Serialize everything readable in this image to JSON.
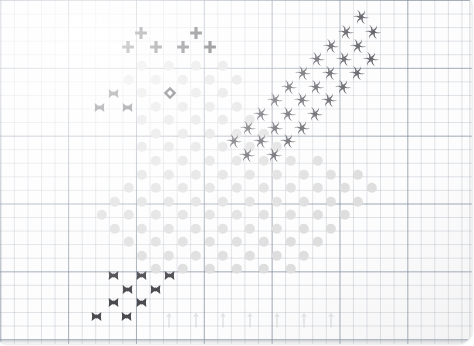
{
  "page": {
    "background_color": "#fdfdfd",
    "grid": {
      "minor_cell_px": 13.57,
      "minor_color": "#96a0af",
      "major_cell_px": 67.85,
      "major_color": "#7884 96",
      "origin_x": 6.3,
      "origin_y": 6.0
    }
  },
  "legend": {
    "dot": {
      "name": "light-gray-dot",
      "color": "#dedede",
      "size_px": 10.4
    },
    "cross": {
      "name": "x-marker",
      "color": "#4a4a4f",
      "size_px": 13
    },
    "plus": {
      "name": "plus-marker",
      "color": "#3c3c41",
      "size_px": 14
    },
    "ring": {
      "name": "hollow-diamond-marker",
      "color": "#2e2e33",
      "size_px": 14
    },
    "pinwheel": {
      "name": "pinwheel-marker",
      "color": "#55555c",
      "size_px": 17
    },
    "arrow": {
      "name": "up-arrow-tick",
      "color": "#b9bcc2",
      "size_px": 17
    }
  },
  "chart_data": {
    "type": "scatter",
    "title": "",
    "subtitle": "",
    "xlabel": "",
    "ylabel": "",
    "grid": true,
    "legend_position": "none",
    "xlim": [
      0,
      474
    ],
    "ylim": [
      0,
      346
    ],
    "note": "Pixel coordinates of every plotted marker, grouped by marker series.",
    "series": [
      {
        "name": "dot",
        "marker": "filled-circle",
        "color": "#dedede",
        "points": [
          [
            142,
            66
          ],
          [
            169,
            66
          ],
          [
            196,
            66
          ],
          [
            223,
            66
          ],
          [
            129,
            80
          ],
          [
            156,
            80
          ],
          [
            183,
            80
          ],
          [
            210,
            80
          ],
          [
            237,
            80
          ],
          [
            142,
            93
          ],
          [
            196,
            93
          ],
          [
            223,
            93
          ],
          [
            156,
            107
          ],
          [
            183,
            107
          ],
          [
            210,
            107
          ],
          [
            237,
            107
          ],
          [
            142,
            120
          ],
          [
            169,
            120
          ],
          [
            196,
            120
          ],
          [
            223,
            120
          ],
          [
            250,
            120
          ],
          [
            156,
            134
          ],
          [
            183,
            134
          ],
          [
            210,
            134
          ],
          [
            237,
            134
          ],
          [
            264,
            134
          ],
          [
            142,
            147
          ],
          [
            169,
            147
          ],
          [
            196,
            147
          ],
          [
            223,
            147
          ],
          [
            250,
            147
          ],
          [
            277,
            147
          ],
          [
            156,
            161
          ],
          [
            183,
            161
          ],
          [
            210,
            161
          ],
          [
            237,
            161
          ],
          [
            264,
            161
          ],
          [
            291,
            161
          ],
          [
            318,
            161
          ],
          [
            142,
            175
          ],
          [
            169,
            175
          ],
          [
            196,
            175
          ],
          [
            223,
            175
          ],
          [
            250,
            175
          ],
          [
            277,
            175
          ],
          [
            304,
            175
          ],
          [
            331,
            175
          ],
          [
            358,
            175
          ],
          [
            129,
            188
          ],
          [
            156,
            188
          ],
          [
            183,
            188
          ],
          [
            210,
            188
          ],
          [
            237,
            188
          ],
          [
            264,
            188
          ],
          [
            291,
            188
          ],
          [
            318,
            188
          ],
          [
            345,
            188
          ],
          [
            372,
            188
          ],
          [
            115,
            202
          ],
          [
            142,
            202
          ],
          [
            169,
            202
          ],
          [
            196,
            202
          ],
          [
            223,
            202
          ],
          [
            250,
            202
          ],
          [
            277,
            202
          ],
          [
            304,
            202
          ],
          [
            331,
            202
          ],
          [
            358,
            202
          ],
          [
            102,
            215
          ],
          [
            129,
            215
          ],
          [
            156,
            215
          ],
          [
            183,
            215
          ],
          [
            210,
            215
          ],
          [
            237,
            215
          ],
          [
            264,
            215
          ],
          [
            291,
            215
          ],
          [
            318,
            215
          ],
          [
            345,
            215
          ],
          [
            115,
            229
          ],
          [
            142,
            229
          ],
          [
            169,
            229
          ],
          [
            196,
            229
          ],
          [
            223,
            229
          ],
          [
            250,
            229
          ],
          [
            277,
            229
          ],
          [
            304,
            229
          ],
          [
            331,
            229
          ],
          [
            129,
            242
          ],
          [
            156,
            242
          ],
          [
            183,
            242
          ],
          [
            210,
            242
          ],
          [
            237,
            242
          ],
          [
            264,
            242
          ],
          [
            291,
            242
          ],
          [
            318,
            242
          ],
          [
            142,
            256
          ],
          [
            169,
            256
          ],
          [
            196,
            256
          ],
          [
            223,
            256
          ],
          [
            250,
            256
          ],
          [
            277,
            256
          ],
          [
            156,
            269
          ],
          [
            183,
            269
          ],
          [
            210,
            269
          ],
          [
            237,
            269
          ],
          [
            264,
            269
          ],
          [
            304,
            256
          ],
          [
            291,
            269
          ]
        ]
      },
      {
        "name": "plus",
        "marker": "plus",
        "color": "#3c3c41",
        "points": [
          [
            141,
            33
          ],
          [
            196,
            33
          ],
          [
            128,
            47
          ],
          [
            156,
            47
          ],
          [
            183,
            47
          ],
          [
            210,
            47
          ]
        ]
      },
      {
        "name": "cross",
        "marker": "x",
        "color": "#4a4a4f",
        "points": [
          [
            113,
            93
          ],
          [
            99,
            107
          ],
          [
            127,
            107
          ],
          [
            113,
            275
          ],
          [
            141,
            275
          ],
          [
            169,
            275
          ],
          [
            127,
            289
          ],
          [
            155,
            289
          ],
          [
            113,
            302
          ],
          [
            141,
            302
          ],
          [
            96,
            316
          ],
          [
            126,
            316
          ]
        ]
      },
      {
        "name": "ring",
        "marker": "hollow-diamond",
        "color": "#2e2e33",
        "points": [
          [
            170,
            93
          ]
        ]
      },
      {
        "name": "pinwheel",
        "marker": "pinwheel",
        "color": "#55555c",
        "points": [
          [
            361,
            17
          ],
          [
            346,
            32
          ],
          [
            373,
            32
          ],
          [
            331,
            46
          ],
          [
            358,
            46
          ],
          [
            317,
            59
          ],
          [
            344,
            59
          ],
          [
            371,
            59
          ],
          [
            303,
            73
          ],
          [
            330,
            73
          ],
          [
            357,
            73
          ],
          [
            289,
            87
          ],
          [
            316,
            87
          ],
          [
            343,
            87
          ],
          [
            275,
            100
          ],
          [
            302,
            100
          ],
          [
            329,
            100
          ],
          [
            261,
            114
          ],
          [
            288,
            114
          ],
          [
            315,
            114
          ],
          [
            248,
            128
          ],
          [
            275,
            128
          ],
          [
            302,
            128
          ],
          [
            234,
            141
          ],
          [
            261,
            141
          ],
          [
            288,
            141
          ],
          [
            247,
            155
          ],
          [
            274,
            155
          ]
        ]
      },
      {
        "name": "arrow",
        "marker": "up-arrow",
        "color": "#b9bcc2",
        "points": [
          [
            169,
            320
          ],
          [
            196,
            320
          ],
          [
            223,
            320
          ],
          [
            250,
            320
          ],
          [
            277,
            320
          ],
          [
            304,
            320
          ],
          [
            331,
            320
          ]
        ]
      }
    ]
  }
}
